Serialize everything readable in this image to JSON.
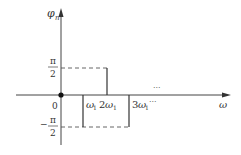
{
  "diagram": {
    "type": "phase spectrum",
    "y_axis_label": "φ",
    "y_axis_subscript": "n",
    "x_axis_label": "ω",
    "origin_label": "0",
    "pi_label": "π",
    "two_label": "2",
    "minus_label": "−",
    "ellipsis": "···",
    "x_ticks": [
      {
        "coef": "",
        "sym": "ω",
        "sub": "1"
      },
      {
        "coef": "2",
        "sym": "ω",
        "sub": "1"
      },
      {
        "coef": "3",
        "sym": "ω",
        "sub": "1"
      }
    ],
    "phase_levels": [
      "π/2",
      "-π/2"
    ],
    "lines": [
      {
        "at": "ω1",
        "phase": "-π/2"
      },
      {
        "at": "2ω1",
        "phase": "π/2"
      },
      {
        "at": "3ω1",
        "phase": "-π/2"
      }
    ],
    "colors": {
      "line": "#333333",
      "dash": "#555555"
    }
  }
}
